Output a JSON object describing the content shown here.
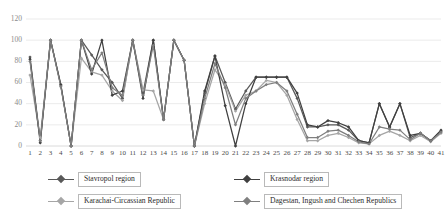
{
  "chart_data": {
    "type": "line",
    "title": "",
    "subtitle": "",
    "xlabel": "",
    "ylabel": "",
    "ylim": [
      0,
      120
    ],
    "ytick_values": [
      0,
      20,
      40,
      60,
      80,
      100,
      120
    ],
    "ytick_labels": [
      "0",
      "20",
      "40",
      "60",
      "80",
      "100",
      "120"
    ],
    "grid": true,
    "grid_axis": "y",
    "legend_position": "bottom",
    "categories": [
      "1",
      "2",
      "3",
      "4",
      "5",
      "6",
      "7",
      "8",
      "9",
      "10",
      "11",
      "12",
      "13",
      "14",
      "15",
      "16",
      "17",
      "18",
      "19",
      "20",
      "21",
      "22",
      "23",
      "24",
      "25",
      "26",
      "27",
      "28",
      "29",
      "30",
      "31",
      "32",
      "33",
      "34",
      "35",
      "36",
      "37",
      "38",
      "39",
      "40",
      "41"
    ],
    "series": [
      {
        "name": "Stavropol region",
        "color": "#595959",
        "marker": "diamond",
        "values": [
          84,
          5,
          100,
          57,
          0,
          100,
          86,
          72,
          60,
          45,
          100,
          50,
          100,
          25,
          100,
          81,
          0,
          50,
          85,
          60,
          35,
          52,
          65,
          65,
          65,
          65,
          45,
          18,
          18,
          20,
          20,
          15,
          5,
          3,
          40,
          18,
          40,
          8,
          12,
          5,
          14
        ]
      },
      {
        "name": "Karachai-Circassian Republic",
        "color": "#a6a6a6",
        "marker": "diamond",
        "values": [
          67,
          8,
          100,
          57,
          0,
          83,
          70,
          67,
          52,
          43,
          100,
          53,
          52,
          25,
          100,
          81,
          0,
          40,
          72,
          58,
          33,
          48,
          52,
          62,
          60,
          48,
          25,
          5,
          5,
          10,
          12,
          8,
          3,
          2,
          10,
          14,
          10,
          5,
          10,
          4,
          12
        ]
      },
      {
        "name": "Krasnodar region",
        "color": "#404040",
        "marker": "diamond",
        "values": [
          82,
          3,
          100,
          58,
          0,
          100,
          68,
          100,
          48,
          52,
          100,
          45,
          100,
          25,
          100,
          81,
          0,
          52,
          85,
          38,
          0,
          40,
          65,
          65,
          65,
          65,
          50,
          20,
          18,
          24,
          22,
          18,
          5,
          3,
          40,
          18,
          40,
          10,
          12,
          5,
          15
        ]
      },
      {
        "name": "Dagestan, Ingush and Chechen Republics",
        "color": "#7f7f7f",
        "marker": "diamond",
        "values": [
          80,
          5,
          100,
          56,
          0,
          100,
          72,
          88,
          55,
          48,
          100,
          48,
          95,
          25,
          100,
          81,
          0,
          45,
          78,
          55,
          20,
          45,
          52,
          58,
          60,
          52,
          30,
          8,
          8,
          14,
          15,
          10,
          4,
          2,
          18,
          16,
          15,
          6,
          12,
          5,
          13
        ]
      }
    ]
  },
  "legend": {
    "entries": [
      {
        "label": "Stavropol region"
      },
      {
        "label": "Krasnodar region"
      },
      {
        "label": "Karachai-Circassian Republic"
      },
      {
        "label": "Dagestan, Ingush and Chechen Republics"
      }
    ]
  }
}
